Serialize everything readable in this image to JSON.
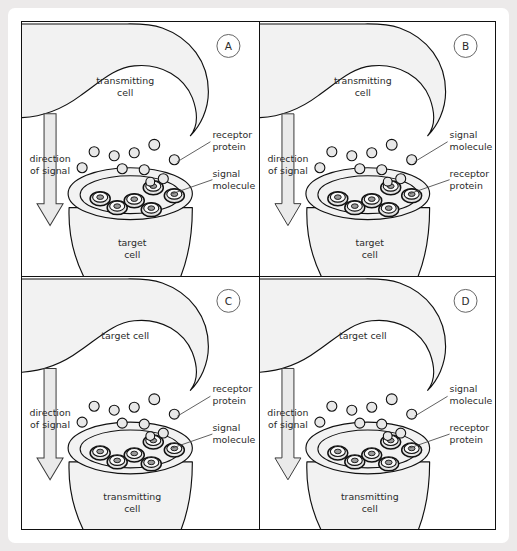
{
  "figure": {
    "type": "cell-signalling-diagram-set",
    "panel_count": 4,
    "colors": {
      "page_background": "#eceaea",
      "card_background": "#ffffff",
      "panel_border": "#111111",
      "cell_fill": "#f2f2f2",
      "arrow_fill": "#eaeaea",
      "text": "#2b2b2b"
    },
    "common": {
      "direction_label_line1": "direction",
      "direction_label_line2": "of signal",
      "receptor_count": 6,
      "signal_molecule_count": 11
    },
    "panels": [
      {
        "letter": "A",
        "position": "top-left",
        "upper_cell_line1": "transmitting",
        "upper_cell_line2": "cell",
        "lower_cell_line1": "target",
        "lower_cell_line2": "cell",
        "arrow_line1": "direction",
        "arrow_line2": "of signal",
        "top_label_line1": "receptor",
        "top_label_line2": "protein",
        "bottom_label_line1": "signal",
        "bottom_label_line2": "molecule"
      },
      {
        "letter": "B",
        "position": "top-right",
        "upper_cell_line1": "transmitting",
        "upper_cell_line2": "cell",
        "lower_cell_line1": "target",
        "lower_cell_line2": "cell",
        "arrow_line1": "direction",
        "arrow_line2": "of signal",
        "top_label_line1": "signal",
        "top_label_line2": "molecule",
        "bottom_label_line1": "receptor",
        "bottom_label_line2": "protein"
      },
      {
        "letter": "C",
        "position": "bottom-left",
        "upper_cell_line1": "target cell",
        "upper_cell_line2": "",
        "lower_cell_line1": "transmitting",
        "lower_cell_line2": "cell",
        "arrow_line1": "direction",
        "arrow_line2": "of signal",
        "top_label_line1": "receptor",
        "top_label_line2": "protein",
        "bottom_label_line1": "signal",
        "bottom_label_line2": "molecule"
      },
      {
        "letter": "D",
        "position": "bottom-right",
        "upper_cell_line1": "target cell",
        "upper_cell_line2": "",
        "lower_cell_line1": "transmitting",
        "lower_cell_line2": "cell",
        "arrow_line1": "direction",
        "arrow_line2": "of signal",
        "top_label_line1": "signal",
        "top_label_line2": "molecule",
        "bottom_label_line1": "receptor",
        "bottom_label_line2": "protein"
      }
    ]
  }
}
